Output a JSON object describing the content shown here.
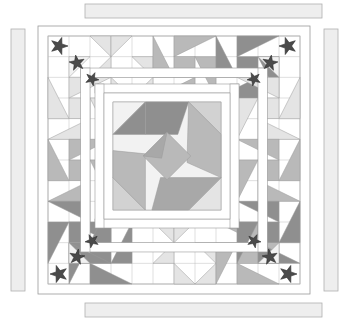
{
  "document": {
    "title": "Medallion Quilt Layout",
    "canvas": {
      "width": 349,
      "height": 322,
      "background": "#ffffff"
    }
  },
  "palette": {
    "background": "#ffffff",
    "patch_light": "#f2f2f2",
    "patch_pale": "#e4e4e4",
    "patch_lightgray": "#d2d2d2",
    "patch_mid": "#b9b9b9",
    "patch_mid2": "#a8a8a8",
    "patch_dark": "#8f8f8f",
    "patch_darker": "#7d7d7d",
    "star_applique": "#4a4a4a",
    "line": "#9a9a9a",
    "line_soft": "#bdbdbd",
    "border_strip_fill": "#eeeeee",
    "border_strip_stroke": "#b0b0b0",
    "sashing": "#ffffff"
  },
  "loose_border_strips": [
    {
      "name": "top-strip",
      "x": 85,
      "y": 4,
      "width": 237,
      "height": 14,
      "orientation": "horizontal"
    },
    {
      "name": "bottom-strip",
      "x": 85,
      "y": 303,
      "width": 237,
      "height": 14,
      "orientation": "horizontal"
    },
    {
      "name": "left-strip",
      "x": 11,
      "y": 29,
      "width": 14,
      "height": 262,
      "orientation": "vertical"
    },
    {
      "name": "right-strip",
      "x": 324,
      "y": 29,
      "width": 14,
      "height": 262,
      "orientation": "vertical"
    }
  ],
  "quilt_top": {
    "x": 38,
    "y": 26,
    "width": 272,
    "height": 268,
    "outer_border_width": 10,
    "grid": {
      "cols": 12,
      "rows": 12,
      "cell": 21
    }
  },
  "center_medallion": {
    "name": "pinwheel-medallion",
    "x": 113,
    "y": 102,
    "size": 108,
    "blades": 4,
    "blade_colors": [
      "#8f8f8f",
      "#b9b9b9",
      "#a8a8a8",
      "#b9b9b9"
    ],
    "corner_colors": [
      "#f2f2f2",
      "#d2d2d2",
      "#e4e4e4",
      "#d2d2d2"
    ],
    "description": "Four-blade swirling pinwheel with octagon silhouette"
  },
  "border_blocks": {
    "description": "Friendship-star / flying-geese blocks set around the pieced border",
    "top": [
      {
        "type": "half-square-triangle-block",
        "shade": "#e4e4e4"
      },
      {
        "type": "friendship-star",
        "shade": "#b9b9b9"
      },
      {
        "type": "friendship-star",
        "shade": "#8f8f8f"
      }
    ],
    "right": [
      {
        "type": "friendship-star",
        "shade": "#e4e4e4"
      },
      {
        "type": "friendship-star",
        "shade": "#b9b9b9"
      },
      {
        "type": "friendship-star",
        "shade": "#8f8f8f"
      }
    ],
    "bottom": [
      {
        "type": "friendship-star",
        "shade": "#8f8f8f"
      },
      {
        "type": "half-square-triangle-block",
        "shade": "#e4e4e4"
      },
      {
        "type": "friendship-star",
        "shade": "#b9b9b9"
      }
    ],
    "left": [
      {
        "type": "friendship-star",
        "shade": "#e4e4e4"
      },
      {
        "type": "friendship-star",
        "shade": "#b9b9b9"
      },
      {
        "type": "friendship-star",
        "shade": "#8f8f8f"
      }
    ]
  },
  "applique_stars": {
    "name": "five-point-star-applique",
    "color": "#4a4a4a",
    "count": 12,
    "placements": [
      {
        "corner": "top-left",
        "x": 59,
        "y": 46,
        "r": 9,
        "rot": 18
      },
      {
        "corner": "top-left",
        "x": 77,
        "y": 63,
        "r": 8,
        "rot": -10
      },
      {
        "corner": "top-left",
        "x": 92,
        "y": 79,
        "r": 7,
        "rot": 25
      },
      {
        "corner": "top-right",
        "x": 288,
        "y": 46,
        "r": 9,
        "rot": -18
      },
      {
        "corner": "top-right",
        "x": 270,
        "y": 63,
        "r": 8,
        "rot": 10
      },
      {
        "corner": "top-right",
        "x": 254,
        "y": 79,
        "r": 7,
        "rot": -25
      },
      {
        "corner": "bottom-left",
        "x": 59,
        "y": 274,
        "r": 9,
        "rot": -18
      },
      {
        "corner": "bottom-left",
        "x": 77,
        "y": 257,
        "r": 8,
        "rot": 10
      },
      {
        "corner": "bottom-left",
        "x": 92,
        "y": 241,
        "r": 7,
        "rot": -25
      },
      {
        "corner": "bottom-right",
        "x": 288,
        "y": 274,
        "r": 9,
        "rot": 18
      },
      {
        "corner": "bottom-right",
        "x": 270,
        "y": 257,
        "r": 8,
        "rot": -10
      },
      {
        "corner": "bottom-right",
        "x": 254,
        "y": 241,
        "r": 7,
        "rot": 25
      }
    ]
  },
  "sashing": {
    "inner_frame": {
      "x": 100,
      "y": 89,
      "width": 134,
      "height": 134,
      "thickness": 9,
      "color": "#ffffff"
    },
    "outer_frame": {
      "x": 48,
      "y": 36,
      "width": 238,
      "height": 238,
      "thickness": 10,
      "color": "#ffffff"
    }
  }
}
